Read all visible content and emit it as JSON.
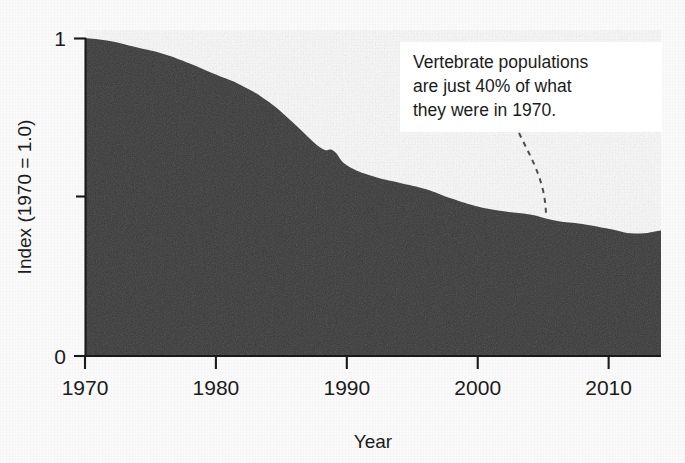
{
  "chart_data": {
    "type": "area",
    "title": "",
    "subtitle": "",
    "xlabel": "Year",
    "ylabel": "Index (1970 = 1.0)",
    "xlim": [
      1970,
      2014
    ],
    "ylim": [
      0,
      1
    ],
    "grid": false,
    "legend": "none",
    "x_ticks": [
      1970,
      1980,
      1990,
      2000,
      2010
    ],
    "x_tick_labels": [
      "1970",
      "1980",
      "1990",
      "2000",
      "2010"
    ],
    "y_ticks": [
      0,
      0.5,
      1
    ],
    "y_tick_labels": [
      "0",
      "",
      "1"
    ],
    "series": [
      {
        "name": "Living Planet Index (vertebrate populations)",
        "x": [
          1970,
          1972,
          1974,
          1976,
          1978,
          1980,
          1982,
          1984,
          1986,
          1988,
          1989,
          1990,
          1992,
          1994,
          1996,
          1998,
          2000,
          2002,
          2004,
          2006,
          2008,
          2010,
          2012,
          2014
        ],
        "values": [
          1.0,
          0.99,
          0.97,
          0.95,
          0.92,
          0.885,
          0.85,
          0.8,
          0.73,
          0.655,
          0.645,
          0.6,
          0.565,
          0.545,
          0.525,
          0.495,
          0.47,
          0.455,
          0.445,
          0.425,
          0.415,
          0.4,
          0.385,
          0.395
        ]
      }
    ],
    "annotations": [
      {
        "text": "Vertebrate populations\nare just 40% of what\nthey were in 1970.",
        "points_to_year": 2004,
        "points_to_value": 0.445
      }
    ]
  },
  "axes": {
    "y_axis_title": "Index (1970 = 1.0)",
    "x_axis_title": "Year",
    "y_label_top": "1",
    "y_label_bottom": "0"
  },
  "annotation": {
    "line1": "Vertebrate populations",
    "line2": "are just 40% of what",
    "line3": "they were in 1970."
  },
  "colors": {
    "area_fill": "#383838",
    "axis": "#1a1a1a",
    "text": "#1b1b1b",
    "background": "#fafafa",
    "annotation_background": "#ffffff",
    "leader_line": "#4d4d4d"
  }
}
